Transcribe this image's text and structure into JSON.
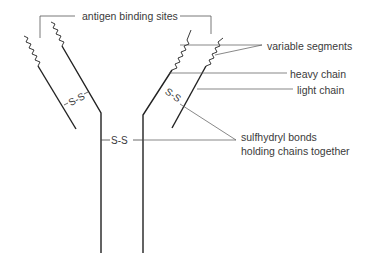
{
  "diagram": {
    "labels": {
      "antigen_binding_sites": "antigen binding sites",
      "variable_segments": "variable segments",
      "heavy_chain": "heavy chain",
      "light_chain": "light chain",
      "sulfhydryl_line1": "sulfhydryl bonds",
      "sulfhydryl_line2": "holding chains together"
    },
    "bonds": {
      "left_arm": "S-S",
      "hinge": "S-S",
      "right_arm": "S-S"
    },
    "colors": {
      "line": "#222222",
      "text": "#3a3a3a",
      "leader": "#555555",
      "background": "#ffffff"
    }
  }
}
